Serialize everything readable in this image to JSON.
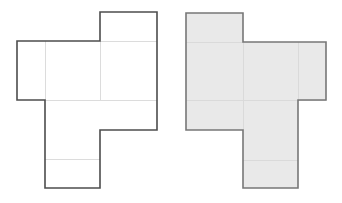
{
  "figure": {
    "background_color": "#ffffff",
    "canvas": {
      "width": 342,
      "height": 203
    },
    "grid": {
      "cell_width": 57,
      "cell_height": 29,
      "note": "Unit cells of the net grid; columns and rows snap to these sizes"
    },
    "styles": {
      "outline_color": "#4d4d4d",
      "outline_width": 1.6,
      "inner_line_color": "#d8d8d8",
      "inner_line_width": 0.9,
      "fill_none": "none",
      "fill_gray": "#e9e9e9"
    },
    "panels": [
      {
        "id": "left-net",
        "name": "left-cube-net",
        "label": "Unfilled cube net",
        "fill": "none",
        "outline": "#4d4d4d",
        "origin": {
          "x": 17,
          "y": 12
        },
        "columns_x": [
          17,
          45,
          100,
          157
        ],
        "rows_y": [
          12,
          41,
          100,
          130,
          159,
          188
        ],
        "outline_path": "M 100 12 L 157 12 L 157 130 L 100 130 L 100 188 L 45 188 L 45 100 L 17 100 L 17 41 L 100 41 Z",
        "inner_lines": [
          {
            "name": "vertical-divider-left",
            "x1": 45,
            "y1": 41,
            "x2": 45,
            "y2": 100
          },
          {
            "name": "vertical-divider-right",
            "x1": 100,
            "y1": 41,
            "x2": 100,
            "y2": 100
          },
          {
            "name": "horizontal-divider-mid",
            "x1": 45,
            "y1": 100,
            "x2": 157,
            "y2": 100
          },
          {
            "name": "horizontal-divider-low",
            "x1": 45,
            "y1": 159,
            "x2": 100,
            "y2": 159
          },
          {
            "name": "horizontal-divider-top",
            "x1": 100,
            "y1": 41,
            "x2": 157,
            "y2": 41
          }
        ],
        "faces": [
          {
            "name": "face-top-right",
            "x": 100,
            "y": 12,
            "w": 57,
            "h": 29
          },
          {
            "name": "face-left",
            "x": 17,
            "y": 41,
            "w": 28,
            "h": 59
          },
          {
            "name": "face-center-left",
            "x": 45,
            "y": 41,
            "w": 55,
            "h": 59
          },
          {
            "name": "face-center-right",
            "x": 100,
            "y": 41,
            "w": 57,
            "h": 59
          },
          {
            "name": "face-lower",
            "x": 45,
            "y": 100,
            "w": 55,
            "h": 59
          },
          {
            "name": "face-bottom",
            "x": 45,
            "y": 159,
            "w": 55,
            "h": 29
          }
        ]
      },
      {
        "id": "right-net",
        "name": "right-cube-net",
        "label": "Gray-filled cube net",
        "fill": "#e9e9e9",
        "outline": "#777777",
        "origin": {
          "x": 186,
          "y": 13
        },
        "columns_x": [
          186,
          243,
          298,
          326
        ],
        "rows_y": [
          13,
          42,
          100,
          130,
          160,
          188
        ],
        "outline_path": "M 186 13 L 243 13 L 243 42 L 326 42 L 326 100 L 298 100 L 298 188 L 243 188 L 243 130 L 186 130 Z",
        "inner_lines": [
          {
            "name": "horizontal-divider-upper",
            "x1": 186,
            "y1": 42,
            "x2": 243,
            "y2": 42
          },
          {
            "name": "horizontal-divider-mid",
            "x1": 186,
            "y1": 100,
            "x2": 326,
            "y2": 100
          },
          {
            "name": "horizontal-divider-low",
            "x1": 243,
            "y1": 160,
            "x2": 298,
            "y2": 160
          },
          {
            "name": "vertical-divider-left",
            "x1": 243,
            "y1": 42,
            "x2": 243,
            "y2": 130
          },
          {
            "name": "vertical-divider-right",
            "x1": 298,
            "y1": 42,
            "x2": 298,
            "y2": 100
          }
        ],
        "faces": [
          {
            "name": "face-top-left",
            "x": 186,
            "y": 13,
            "w": 57,
            "h": 29
          },
          {
            "name": "face-left-upper",
            "x": 186,
            "y": 42,
            "w": 57,
            "h": 58
          },
          {
            "name": "face-left-lower",
            "x": 186,
            "y": 100,
            "w": 57,
            "h": 30
          },
          {
            "name": "face-center",
            "x": 243,
            "y": 42,
            "w": 55,
            "h": 58
          },
          {
            "name": "face-right",
            "x": 298,
            "y": 42,
            "w": 28,
            "h": 58
          },
          {
            "name": "face-bottom-upper",
            "x": 243,
            "y": 100,
            "w": 55,
            "h": 60
          },
          {
            "name": "face-bottom-lower",
            "x": 243,
            "y": 160,
            "w": 55,
            "h": 28
          }
        ]
      }
    ]
  }
}
